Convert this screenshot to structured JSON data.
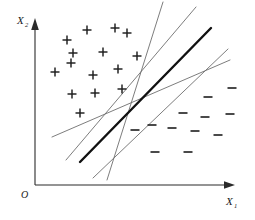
{
  "figure": {
    "background_color": "#ffffff",
    "width": 255,
    "height": 220
  },
  "axes": {
    "x_label": "X",
    "x_label_sub": "1",
    "y_label": "X",
    "y_label_sub": "2",
    "origin_label": "O",
    "axis_color": "#2b2b2b",
    "x_axis": {
      "x1": 35,
      "y1": 185,
      "x2": 232,
      "y2": 185
    },
    "y_axis": {
      "x1": 35,
      "y1": 185,
      "x2": 35,
      "y2": 21
    },
    "arrow_style": "solid-triangle"
  },
  "chart_data": {
    "type": "scatter",
    "xlabel": "X1",
    "ylabel": "X2",
    "xlim": [
      35,
      232
    ],
    "ylim": [
      21,
      185
    ],
    "grid": false,
    "legend": "none",
    "series": [
      {
        "name": "Class +",
        "marker": "plus",
        "color": "#1d1d1d",
        "size": 9,
        "points": [
          [
            87,
            30
          ],
          [
            115,
            28
          ],
          [
            127,
            33
          ],
          [
            67,
            40
          ],
          [
            73,
            53
          ],
          [
            103,
            52
          ],
          [
            71,
            63
          ],
          [
            137,
            56
          ],
          [
            55,
            72
          ],
          [
            93,
            75
          ],
          [
            118,
            69
          ],
          [
            72,
            94
          ],
          [
            95,
            93
          ],
          [
            122,
            89
          ],
          [
            80,
            113
          ]
        ]
      },
      {
        "name": "Class -",
        "marker": "minus",
        "color": "#2a2a2a",
        "size": 9,
        "points": [
          [
            232,
            88
          ],
          [
            208,
            97
          ],
          [
            183,
            113
          ],
          [
            205,
            117
          ],
          [
            230,
            114
          ],
          [
            152,
            125
          ],
          [
            172,
            128
          ],
          [
            195,
            131
          ],
          [
            135,
            130
          ],
          [
            218,
            135
          ],
          [
            155,
            152
          ],
          [
            188,
            152
          ]
        ]
      }
    ],
    "lines": [
      {
        "name": "candidate-line-1",
        "role": "candidate separator",
        "style": "thin",
        "color": "#6e6e6e",
        "x1": 52,
        "y1": 137,
        "x2": 230,
        "y2": 60
      },
      {
        "name": "candidate-line-2",
        "role": "candidate separator",
        "style": "thin",
        "color": "#6e6e6e",
        "x1": 66,
        "y1": 160,
        "x2": 196,
        "y2": 7
      },
      {
        "name": "candidate-line-3",
        "role": "candidate separator",
        "style": "thin",
        "color": "#6e6e6e",
        "x1": 107,
        "y1": 180,
        "x2": 163,
        "y2": 2
      },
      {
        "name": "candidate-line-4",
        "role": "candidate separator",
        "style": "thin",
        "color": "#6e6e6e",
        "x1": 93,
        "y1": 178,
        "x2": 228,
        "y2": 49
      },
      {
        "name": "optimal-separator",
        "role": "optimal separating hyperplane",
        "style": "bold",
        "color": "#111111",
        "x1": 80,
        "y1": 162,
        "x2": 211,
        "y2": 28
      }
    ],
    "annotations": []
  }
}
